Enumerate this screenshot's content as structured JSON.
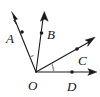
{
  "figure": {
    "type": "geometry-diagram",
    "background_color": "#ffffff",
    "line_color": "#1a1a1a",
    "arc_color": "#8a8a8a",
    "vertex": {
      "name": "O",
      "label": "O",
      "x": 36,
      "y": 72,
      "label_x": 32,
      "label_y": 88
    },
    "rays": [
      {
        "id": "ray-OA",
        "label": "A",
        "point_label": "A",
        "from_x": 36,
        "from_y": 72,
        "to_x": 12,
        "to_y": 13,
        "dot_x": 22,
        "dot_y": 32,
        "label_x": 7,
        "label_y": 42,
        "arrow_angle_deg": 248
      },
      {
        "id": "ray-OB",
        "label": "B",
        "point_label": "B",
        "from_x": 36,
        "from_y": 72,
        "to_x": 44,
        "to_y": 13,
        "dot_x": 42,
        "dot_y": 33,
        "label_x": 48,
        "label_y": 39,
        "arrow_angle_deg": 278
      },
      {
        "id": "ray-OC",
        "label": "C",
        "point_label": "C",
        "from_x": 36,
        "from_y": 72,
        "to_x": 94,
        "to_y": 39,
        "dot_x": 77,
        "dot_y": 49,
        "label_x": 80,
        "label_y": 64,
        "arrow_angle_deg": 330
      },
      {
        "id": "ray-OD",
        "label": "D",
        "point_label": "D",
        "from_x": 36,
        "from_y": 72,
        "to_x": 96,
        "to_y": 72,
        "dot_x": 72,
        "dot_y": 72,
        "label_x": 69,
        "label_y": 89,
        "arrow_angle_deg": 0
      }
    ],
    "angle_marks": [
      {
        "id": "angle-AOB",
        "between": "A-O-B",
        "radius": 16,
        "start_deg": 112,
        "end_deg": 82
      },
      {
        "id": "angle-COD",
        "between": "C-O-D",
        "radius": 18,
        "start_deg": 330,
        "end_deg": 360
      }
    ]
  }
}
